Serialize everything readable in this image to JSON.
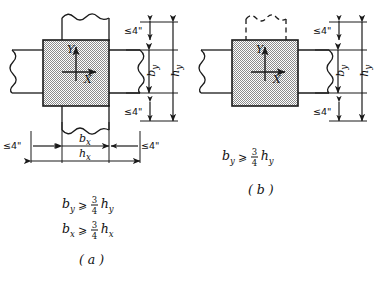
{
  "figure": {
    "kind": "engineering-detail-diagram",
    "line_color": "#1a1a1a",
    "hatch_color": "#808080",
    "background": "#ffffff"
  },
  "panels": [
    {
      "id": "a",
      "label": "( a )",
      "axes": {
        "y_label": "Y",
        "x_label": "X"
      },
      "clearances": [
        {
          "name": "top",
          "text": "≤4\""
        },
        {
          "name": "bottom",
          "text": "≤4\""
        },
        {
          "name": "left",
          "text": "≤4\""
        },
        {
          "name": "right",
          "text": "≤4\""
        }
      ],
      "dimensions": [
        {
          "name": "b_y",
          "base": "b",
          "sub": "y",
          "orientation": "vertical"
        },
        {
          "name": "h_y",
          "base": "h",
          "sub": "y",
          "orientation": "vertical"
        },
        {
          "name": "b_x",
          "base": "b",
          "sub": "x",
          "orientation": "horizontal"
        },
        {
          "name": "h_x",
          "base": "h",
          "sub": "x",
          "orientation": "horizontal"
        }
      ],
      "equations": [
        {
          "lhs_base": "b",
          "lhs_sub": "y",
          "relation": "⩾",
          "num": "3",
          "den": "4",
          "rhs_base": "h",
          "rhs_sub": "y"
        },
        {
          "lhs_base": "b",
          "lhs_sub": "x",
          "relation": "⩾",
          "num": "3",
          "den": "4",
          "rhs_base": "h",
          "rhs_sub": "x"
        }
      ]
    },
    {
      "id": "b",
      "label": "( b )",
      "axes": {
        "y_label": "Y",
        "x_label": "X"
      },
      "clearances": [
        {
          "name": "top",
          "text": "≤4\""
        },
        {
          "name": "bottom",
          "text": "≤4\""
        }
      ],
      "dimensions": [
        {
          "name": "b_y",
          "base": "b",
          "sub": "y",
          "orientation": "vertical"
        },
        {
          "name": "h_y",
          "base": "h",
          "sub": "y",
          "orientation": "vertical"
        }
      ],
      "equations": [
        {
          "lhs_base": "b",
          "lhs_sub": "y",
          "relation": "⩾",
          "num": "3",
          "den": "4",
          "rhs_base": "h",
          "rhs_sub": "y"
        }
      ]
    }
  ]
}
